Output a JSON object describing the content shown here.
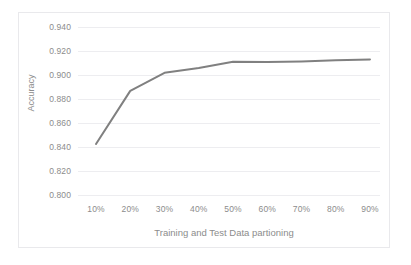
{
  "chart_data": {
    "type": "line",
    "title": "",
    "xlabel": "Training and Test Data partioning",
    "ylabel": "Accuracy",
    "categories": [
      "10%",
      "20%",
      "30%",
      "40%",
      "50%",
      "60%",
      "70%",
      "80%",
      "90%"
    ],
    "x_values": [
      10,
      20,
      30,
      40,
      50,
      60,
      70,
      80,
      90
    ],
    "series": [
      {
        "name": "Accuracy",
        "values": [
          0.8425,
          0.8868,
          0.9018,
          0.9058,
          0.911,
          0.9108,
          0.9112,
          0.9122,
          0.913
        ],
        "color": "#808080"
      }
    ],
    "ylim": [
      0.8,
      0.94
    ],
    "ytick_values": [
      0.94,
      0.92,
      0.9,
      0.88,
      0.86,
      0.84,
      0.82,
      0.8
    ],
    "ytick_labels": [
      "0.940",
      "0.920",
      "0.900",
      "0.880",
      "0.860",
      "0.840",
      "0.820",
      "0.800"
    ],
    "xtick_labels": [
      "10%",
      "20%",
      "30%",
      "40%",
      "50%",
      "60%",
      "70%",
      "80%",
      "90%"
    ],
    "grid": true,
    "grid_color": "#ededf0",
    "legend": "none",
    "border_color": "#e9e9ec",
    "text_color": "#8c8c8c",
    "background": "#ffffff"
  }
}
